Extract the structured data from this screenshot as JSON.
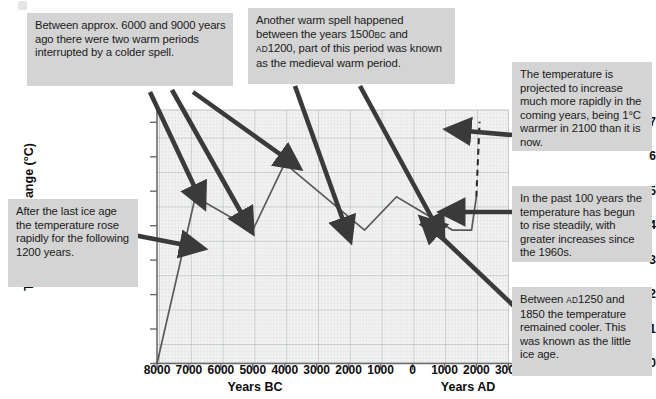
{
  "chart_data": {
    "type": "line",
    "title": "",
    "xlabel_left": "Years BC",
    "xlabel_right": "Years AD",
    "ylabel": "Temperature change (°C)",
    "xlim": [
      -8000,
      3000
    ],
    "ylim": [
      0,
      7.6
    ],
    "grid": true,
    "grid_note": "fine graph paper grid, major gridlines every 1000 years and every 1 °C",
    "xticks": [
      -8000,
      -7000,
      -6000,
      -5000,
      -4000,
      -3000,
      -2000,
      -1000,
      0,
      1000,
      2000,
      3000
    ],
    "xtick_labels": [
      "8000",
      "7000",
      "6000",
      "5000",
      "4000",
      "3000",
      "2000",
      "1000",
      "0",
      "1000",
      "2000",
      "3000"
    ],
    "yticks": [
      0,
      1,
      2,
      3,
      4,
      5,
      6,
      7
    ],
    "ytick_labels": [
      "0",
      "1",
      "2",
      "3",
      "4",
      "5",
      "6",
      "7"
    ],
    "series": [
      {
        "name": "Observed temperature change",
        "style": "solid",
        "color": "#5a5a5a",
        "x": [
          -8000,
          -6800,
          -5000,
          -4000,
          -1500,
          -500,
          1250,
          1850,
          2000
        ],
        "y": [
          0,
          5,
          4,
          6,
          4,
          5,
          4,
          4,
          5
        ]
      },
      {
        "name": "Projected temperature change",
        "style": "dashed",
        "color": "#2b2b2b",
        "x": [
          2000,
          2100
        ],
        "y": [
          5,
          7.25
        ]
      }
    ],
    "annotations": [
      {
        "id": "warm-periods",
        "text": "Between approx. 6000 and 9000 years ago there were two warm periods interrupted by a colder spell.",
        "points_to": [
          "-6800 / 5",
          "-5000 / 4",
          "-4000 / 6"
        ]
      },
      {
        "id": "ice-age",
        "text": "After the last ice age the temperature rose rapidly for the following 1200 years.",
        "points_to": [
          "-7600 / 3.3"
        ]
      },
      {
        "id": "warm-spell",
        "text": "Another warm spell happened between the years 1500BC and AD1200, part of this period was known as the medieval warm period.",
        "points_to": [
          "-1500 / 4",
          "1250 / 4"
        ]
      },
      {
        "id": "projection",
        "text": "The temperature is projected to increase much more rapidly in the coming years, being 1°C warmer in 2100 than it is now.",
        "points_to": [
          "2060 / 6.6"
        ]
      },
      {
        "id": "past-100",
        "text": "In the past 100 years the temperature has begun to rise steadily, with greater increases since the 1960s.",
        "points_to": [
          "2000 / 4.8"
        ]
      },
      {
        "id": "little-ice-age",
        "text": "Between AD1250 and 1850 the temperature remained cooler. This was known as the little ice age.",
        "points_to": [
          "1500 / 4.05"
        ]
      }
    ]
  },
  "callouts": {
    "warm_periods": "Between approx. 6000 and 9000 years ago there were two warm periods interrupted by a colder spell.",
    "ice_age": "After the last ice age the temperature rose rapidly for the following 1200 years.",
    "warm_spell_part1": "Another warm spell happened between the years 1500",
    "warm_spell_bc": "BC",
    "warm_spell_part2": " and ",
    "warm_spell_ad": "AD",
    "warm_spell_part3": "1200, part of this period was known as the medieval warm period.",
    "projection": "The temperature is projected to increase much more rapidly in the coming years, being 1°C warmer in 2100 than it is now.",
    "past_100": "In the past 100 years the temperature has begun to rise steadily, with greater increases since the 1960s.",
    "little_ice_part1": "Between ",
    "little_ice_ad": "AD",
    "little_ice_part2": "1250 and 1850 the temperature remained cooler. This was known as the little ice age."
  },
  "axes": {
    "ylabel": "Temperature change (°C)",
    "xlabel_bc": "Years BC",
    "xlabel_ad": "Years AD",
    "xtick_labels": [
      "8000",
      "7000",
      "6000",
      "5000",
      "4000",
      "3000",
      "2000",
      "1000",
      "0",
      "1000",
      "2000",
      "3000"
    ],
    "ytick_labels": [
      "0",
      "1",
      "2",
      "3",
      "4",
      "5",
      "6",
      "7"
    ]
  },
  "colors": {
    "callout_bg": "#d4d4d4",
    "line": "#5a5a5a",
    "arrow": "#3a3a3a",
    "grid_minor": "#c8cdd2",
    "grid_major": "#a9b0b6",
    "axis": "#6b6b6b",
    "plot_bg": "#f3f4f2"
  }
}
